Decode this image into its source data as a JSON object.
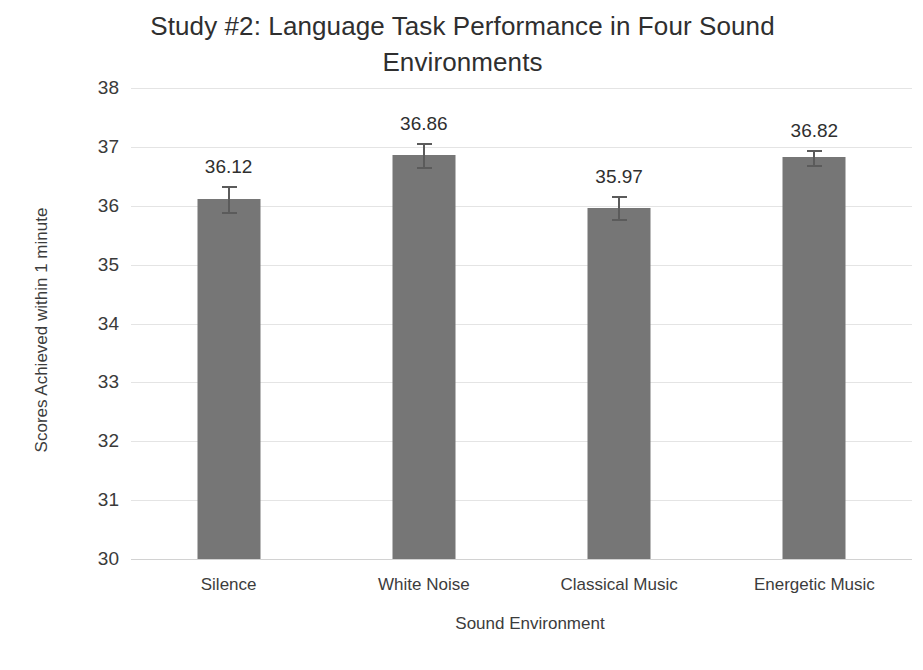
{
  "chart_data": {
    "type": "bar",
    "title": "Study #2: Language Task Performance in Four Sound Environments",
    "title_line1": "Study #2: Language Task Performance in Four Sound",
    "title_line2": "Environments",
    "xlabel": "Sound Environment",
    "ylabel": "Scores Achieved within 1 minute",
    "categories": [
      "Silence",
      "White Noise",
      "Classical Music",
      "Energetic Music"
    ],
    "values": [
      36.12,
      36.86,
      35.97,
      36.82
    ],
    "value_labels": [
      "36.12",
      "36.86",
      "35.97",
      "36.82"
    ],
    "errors": [
      0.22,
      0.2,
      0.2,
      0.12
    ],
    "ylim": [
      30,
      38
    ],
    "yticks": [
      "38",
      "37",
      "36",
      "35",
      "34",
      "33",
      "32",
      "31",
      "30"
    ],
    "ytick_values": [
      38,
      37,
      36,
      35,
      34,
      33,
      32,
      31,
      30
    ],
    "grid": true,
    "legend": false,
    "bar_color": "#767676",
    "gridline_color": "#e4e4e4",
    "error_bar_color": "#5b5b5b",
    "text_color": "#3b3b3b"
  }
}
